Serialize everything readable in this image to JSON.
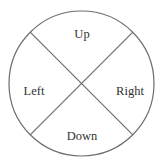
{
  "diagram": {
    "type": "circle-quadrants",
    "colors": {
      "stroke": "#6e6e6e",
      "text": "#333333",
      "background": "#ffffff"
    },
    "labels": {
      "up": "Up",
      "left": "Left",
      "right": "Right",
      "down": "Down"
    }
  }
}
